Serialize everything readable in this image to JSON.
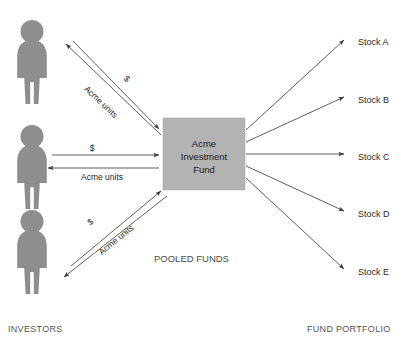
{
  "diagram": {
    "title_hidden": "",
    "fund_box": {
      "lines": [
        "Acme",
        "Investment",
        "Fund"
      ],
      "color": "#b3b3b3",
      "x": 163,
      "y": 118,
      "width": 82,
      "height": 72
    },
    "investors": {
      "section_label": "INVESTORS",
      "figure_color": "#8e8e8e",
      "count": 3,
      "items": [
        {
          "id": "investor-top",
          "money_label": "$",
          "units_label": "Acme units"
        },
        {
          "id": "investor-middle",
          "money_label": "$",
          "units_label": "Acme units"
        },
        {
          "id": "investor-bottom",
          "money_label": "$",
          "units_label": "Acme units"
        }
      ]
    },
    "pooled_funds_label": "POOLED FUNDS",
    "portfolio": {
      "section_label": "FUND PORTFOLIO",
      "holdings": [
        {
          "label": "Stock A",
          "y": 42
        },
        {
          "label": "Stock B",
          "y": 100
        },
        {
          "label": "Stock C",
          "y": 157
        },
        {
          "label": "Stock D",
          "y": 214
        },
        {
          "label": "Stock E",
          "y": 272
        }
      ]
    },
    "colors": {
      "line": "#4d4d4d",
      "text": "#2a2a2a",
      "section_text": "#555555",
      "background": "#ffffff"
    }
  }
}
